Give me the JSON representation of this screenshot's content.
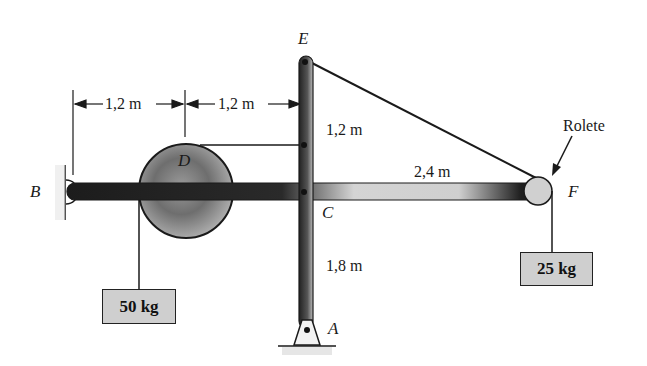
{
  "diagram": {
    "type": "statics frame problem",
    "points": {
      "A": "A",
      "B": "B",
      "C": "C",
      "D": "D",
      "E": "E",
      "F": "F"
    },
    "dimensions": {
      "B_to_D": "1,2 m",
      "D_to_EA": "1,2 m",
      "E_to_D_level": "1,2 m",
      "C_to_F": "2,4 m",
      "C_to_A": "1,8 m"
    },
    "labels": {
      "roller": "Rolete"
    },
    "masses": {
      "left": "50 kg",
      "right": "25 kg"
    },
    "colors": {
      "line": "#1a1a1a",
      "dark_bar": "#222222",
      "light_bar": "#d8d8d8",
      "box_fill": "#cfcfcf"
    }
  }
}
